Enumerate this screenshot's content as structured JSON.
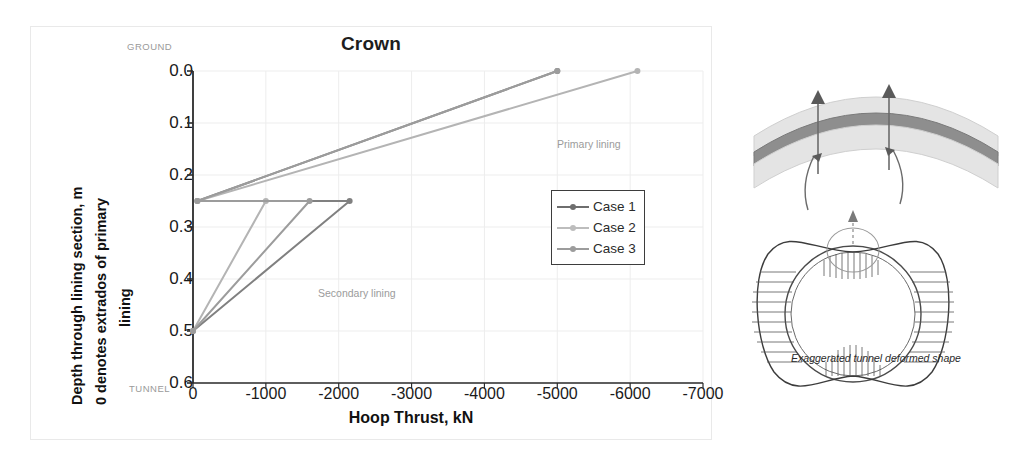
{
  "chart_data": {
    "type": "line",
    "title": "Crown",
    "xlabel": "Hoop Thrust, kN",
    "ylabel": "Depth through lining section, m 0 denotes extrados of primary lining",
    "ylabel_line1": "Depth through lining section, m",
    "ylabel_line2": "0 denotes extrados of primary",
    "ylabel_line3": "lining",
    "xlim": [
      0,
      -7000
    ],
    "ylim": [
      0.0,
      0.6
    ],
    "y_inverted": true,
    "grid": true,
    "legend_position": "inside-right",
    "xticks": [
      0,
      -1000,
      -2000,
      -3000,
      -4000,
      -5000,
      -6000,
      -7000
    ],
    "xtick_labels": [
      "0",
      "-1000",
      "-2000",
      "-3000",
      "-4000",
      "-5000",
      "-6000",
      "-7000"
    ],
    "yticks": [
      0.0,
      0.1,
      0.2,
      0.3,
      0.4,
      0.5,
      0.6
    ],
    "ytick_labels": [
      "0.0",
      "0.1",
      "0.2",
      "0.3",
      "0.4",
      "0.5",
      "0.6"
    ],
    "axis_end_labels": {
      "top": "GROUND",
      "bottom": "TUNNEL"
    },
    "annotations": [
      {
        "text": "Primary lining",
        "x": -4100,
        "y": 0.075
      },
      {
        "text": "Secondary lining",
        "x": -1500,
        "y": 0.4
      }
    ],
    "series": [
      {
        "name": "Case 1",
        "color": "#808080",
        "points": [
          {
            "x": -5000,
            "y": 0.0
          },
          {
            "x": -60,
            "y": 0.25
          },
          {
            "x": -2150,
            "y": 0.25
          },
          {
            "x": 0,
            "y": 0.5
          }
        ]
      },
      {
        "name": "Case 2",
        "color": "#b4b4b4",
        "points": [
          {
            "x": -6100,
            "y": 0.0
          },
          {
            "x": -60,
            "y": 0.25
          },
          {
            "x": -1000,
            "y": 0.25
          },
          {
            "x": 0,
            "y": 0.5
          }
        ]
      },
      {
        "name": "Case 3",
        "color": "#9c9c9c",
        "points": [
          {
            "x": -5000,
            "y": 0.0
          },
          {
            "x": -60,
            "y": 0.25
          },
          {
            "x": -1600,
            "y": 0.25
          },
          {
            "x": 0,
            "y": 0.5
          }
        ]
      }
    ]
  },
  "legend": {
    "items": [
      {
        "label": "Case 1",
        "color": "#6e6e6e"
      },
      {
        "label": "Case 2",
        "color": "#bdbdbd"
      },
      {
        "label": "Case 3",
        "color": "#9c9c9c"
      }
    ]
  },
  "illustration": {
    "caption": "Exaggerated tunnel deformed shape"
  }
}
